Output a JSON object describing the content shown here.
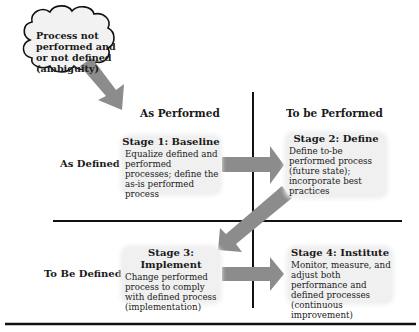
{
  "cloud": {
    "label": "Process not performed and or not defined (ambiguity)"
  },
  "columns": [
    {
      "label": "As Performed"
    },
    {
      "label": "To be Performed"
    }
  ],
  "rows": [
    {
      "label": "As Defined"
    },
    {
      "label": "To Be Defined"
    }
  ],
  "stages": [
    {
      "title": "Stage 1: Baseline",
      "description": "Equalize defined and performed processes; define the as-is performed process"
    },
    {
      "title": "Stage 2: Define",
      "description": "Define to-be performed process (future state); incorporate best practices"
    },
    {
      "title": "Stage 3: Implement",
      "description": "Change performed process to comply with defined process (implementation)"
    },
    {
      "title": "Stage 4: Institute",
      "description": "Monitor, measure, and adjust both performance and defined processes (continuous improvement)"
    }
  ],
  "colors": {
    "arrow": "#8c8c8c",
    "stage_box": "#f0f0f0",
    "line": "#111111"
  }
}
